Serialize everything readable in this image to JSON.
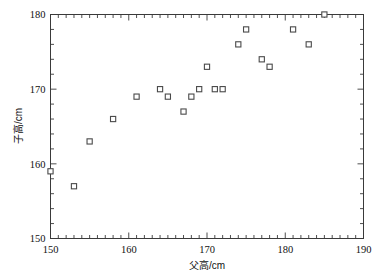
{
  "chart_data": {
    "type": "scatter",
    "title": "",
    "xlabel": "父高/cm",
    "ylabel": "子高/cm",
    "xlim": [
      150,
      190
    ],
    "ylim": [
      150,
      180
    ],
    "xticks": [
      150,
      160,
      170,
      180,
      190
    ],
    "xticklabels": [
      "150",
      "160",
      "170",
      "180",
      "190"
    ],
    "yticks": [
      150,
      160,
      170,
      180
    ],
    "yticklabels": [
      "150",
      "160",
      "170",
      "180"
    ],
    "x_minor_tick_step": 1,
    "y_minor_tick_step": 2,
    "grid": false,
    "legend": null,
    "marker": "open-square",
    "marker_color": "#4a4a4a",
    "points": [
      {
        "x": 150,
        "y": 159
      },
      {
        "x": 153,
        "y": 157
      },
      {
        "x": 155,
        "y": 163
      },
      {
        "x": 158,
        "y": 166
      },
      {
        "x": 161,
        "y": 169
      },
      {
        "x": 164,
        "y": 170
      },
      {
        "x": 165,
        "y": 169
      },
      {
        "x": 167,
        "y": 167
      },
      {
        "x": 168,
        "y": 169
      },
      {
        "x": 169,
        "y": 170
      },
      {
        "x": 170,
        "y": 173
      },
      {
        "x": 171,
        "y": 170
      },
      {
        "x": 172,
        "y": 170
      },
      {
        "x": 174,
        "y": 176
      },
      {
        "x": 175,
        "y": 178
      },
      {
        "x": 177,
        "y": 174
      },
      {
        "x": 178,
        "y": 173
      },
      {
        "x": 181,
        "y": 178
      },
      {
        "x": 183,
        "y": 176
      },
      {
        "x": 185,
        "y": 180
      }
    ]
  },
  "axis_titles": {
    "x": "父高/cm",
    "y": "子高/cm"
  }
}
